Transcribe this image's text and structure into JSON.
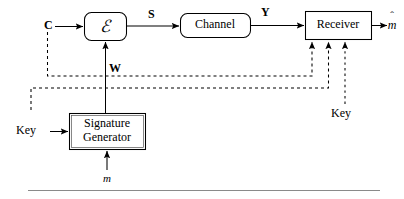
{
  "figure": {
    "type": "block-diagram",
    "background": "#ffffff",
    "line_color": "#000000",
    "rule_color": "#8a8a8a"
  },
  "blocks": [
    {
      "id": "encoder",
      "label": "ℰ",
      "shape": "rounded-rect",
      "x": 84,
      "y": 12,
      "w": 42,
      "h": 28
    },
    {
      "id": "channel",
      "label": "Channel",
      "shape": "rounded-rect",
      "x": 180,
      "y": 13,
      "w": 70,
      "h": 25
    },
    {
      "id": "receiver",
      "label": "Receiver",
      "shape": "rect",
      "x": 305,
      "y": 11,
      "w": 66,
      "h": 28
    },
    {
      "id": "signature",
      "label": "Signature\nGenerator",
      "shape": "rect",
      "x": 69,
      "y": 113,
      "w": 76,
      "h": 36
    }
  ],
  "block_labels": {
    "encoder": "ℰ",
    "channel": "Channel",
    "receiver": "Receiver",
    "signature_line1": "Signature",
    "signature_line2": "Generator"
  },
  "signal_labels": [
    {
      "id": "cover",
      "text": "C",
      "style": "bold",
      "x": 44,
      "y": 18
    },
    {
      "id": "stego",
      "text": "S",
      "style": "bold",
      "x": 148,
      "y": 9
    },
    {
      "id": "received",
      "text": "Y",
      "style": "bold",
      "x": 261,
      "y": 7
    },
    {
      "id": "watermark",
      "text": "W",
      "style": "bold",
      "x": 105,
      "y": 65
    },
    {
      "id": "key-left",
      "text": "Key",
      "style": "normal",
      "x": 17,
      "y": 119
    },
    {
      "id": "key-right",
      "text": "Key",
      "style": "normal",
      "x": 331,
      "y": 106
    },
    {
      "id": "message",
      "text": "m",
      "style": "italic",
      "x": 103,
      "y": 172
    }
  ],
  "message_hat": {
    "id": "message-estimate",
    "hat": "ˆ",
    "base": "m",
    "x": 383,
    "y": 9
  },
  "connections": [
    {
      "id": "c-to-encoder",
      "from": "C",
      "to": "encoder",
      "style": "solid",
      "arrow": true
    },
    {
      "id": "encoder-to-channel",
      "from": "encoder",
      "to": "channel",
      "style": "solid",
      "arrow": true,
      "label": "S"
    },
    {
      "id": "channel-to-receiver",
      "from": "channel",
      "to": "receiver",
      "style": "solid",
      "arrow": true,
      "label": "Y"
    },
    {
      "id": "receiver-to-mhat",
      "from": "receiver",
      "to": "m-hat",
      "style": "solid",
      "arrow": true
    },
    {
      "id": "siggen-to-encoder",
      "from": "signature",
      "to": "encoder",
      "style": "solid",
      "arrow": true,
      "label": "W"
    },
    {
      "id": "key-to-siggen",
      "from": "Key",
      "to": "signature",
      "style": "solid",
      "arrow": true
    },
    {
      "id": "m-to-siggen",
      "from": "m",
      "to": "signature",
      "style": "solid",
      "arrow": true
    },
    {
      "id": "c-side-to-receiver",
      "from": "C",
      "to": "receiver",
      "style": "dashed",
      "arrow": true
    },
    {
      "id": "w-side-to-receiver",
      "from": "W",
      "to": "receiver",
      "style": "dashed",
      "arrow": true
    },
    {
      "id": "key-right-to-receiver",
      "from": "Key (right)",
      "to": "receiver",
      "style": "dotted",
      "arrow": true
    }
  ],
  "footer_rule": {
    "x1": 28,
    "x2": 380,
    "y": 190
  }
}
